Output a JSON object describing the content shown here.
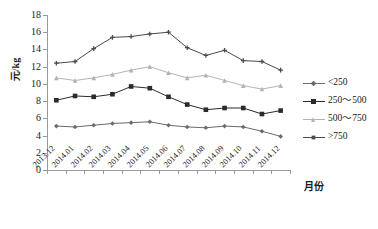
{
  "chart_data": {
    "type": "line",
    "title": "",
    "xlabel": "月份",
    "ylabel": "元/kg",
    "ylim": [
      0,
      18
    ],
    "ytick_step": 2,
    "grid": false,
    "legend_position": "right",
    "yticks": [
      "0",
      "2",
      "4",
      "6",
      "8",
      "10",
      "12",
      "14",
      "16",
      "18"
    ],
    "categories": [
      "2013.12",
      "2014.01",
      "2014.02",
      "2014.03",
      "2014.04",
      "2014.05",
      "2014.06",
      "2014.07",
      "2014.08",
      "2014.09",
      "2014.10",
      "2014.11",
      "2014.12"
    ],
    "series": [
      {
        "name": "<250",
        "color": "#6b6b6b",
        "marker": "diamond",
        "values": [
          5.1,
          5.0,
          5.2,
          5.4,
          5.5,
          5.6,
          5.2,
          5.0,
          4.9,
          5.1,
          5.0,
          4.5,
          3.9
        ]
      },
      {
        "name": "250～500",
        "color": "#2b2b2b",
        "marker": "square",
        "values": [
          8.1,
          8.6,
          8.5,
          8.8,
          9.7,
          9.5,
          8.5,
          7.6,
          7.0,
          7.2,
          7.2,
          6.5,
          6.9
        ]
      },
      {
        "name": "500～750",
        "color": "#b3b3b3",
        "marker": "triangle",
        "values": [
          10.7,
          10.4,
          10.7,
          11.1,
          11.6,
          12.0,
          11.3,
          10.7,
          11.0,
          10.4,
          9.8,
          9.4,
          9.8
        ]
      },
      {
        "name": ">750",
        "color": "#4a4a4a",
        "marker": "cross",
        "values": [
          12.4,
          12.6,
          14.1,
          15.4,
          15.5,
          15.8,
          16.0,
          14.2,
          13.3,
          13.9,
          12.7,
          12.6,
          11.6
        ]
      }
    ]
  },
  "legend": {
    "items": [
      {
        "label": "<250"
      },
      {
        "label": "250～500"
      },
      {
        "label": "500～750"
      },
      {
        "label": ">750"
      }
    ]
  }
}
